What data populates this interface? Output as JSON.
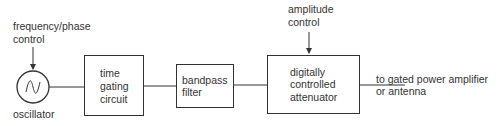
{
  "diagram": {
    "oscillator": {
      "label": "oscillator",
      "control_label_lines": [
        "frequency/phase",
        "control"
      ]
    },
    "time_gating": {
      "lines": [
        "time",
        "gating",
        "circuit"
      ]
    },
    "bandpass": {
      "lines": [
        "bandpass",
        "filter"
      ]
    },
    "attenuator": {
      "lines": [
        "digitally",
        "controlled",
        "attenuator"
      ],
      "control_label_lines": [
        "amplitude",
        "control"
      ]
    },
    "output": {
      "lines": [
        "to gated power amplifier",
        "or antenna"
      ]
    }
  }
}
